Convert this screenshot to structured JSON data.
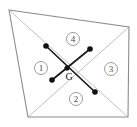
{
  "figure": {
    "canvas": {
      "width": 137,
      "height": 127,
      "background": "#ffffff"
    },
    "colors": {
      "outline": "#8c8c8c",
      "diagonal": "#b9b9b9",
      "connector": "#1a1a1a",
      "dot": "#111111",
      "label": "#4a4a4a"
    },
    "quadrilateral": {
      "name": "outer-quadrilateral",
      "points": "9,10 129,27 128,117 28,117",
      "vertices": [
        {
          "name": "top-left",
          "x": 9,
          "y": 10
        },
        {
          "name": "top-right",
          "x": 129,
          "y": 27
        },
        {
          "name": "bottom-right",
          "x": 128,
          "y": 117
        },
        {
          "name": "bottom-left",
          "x": 28,
          "y": 117
        }
      ]
    },
    "diagonals": [
      {
        "name": "diagonal-tl-br",
        "x1": 9,
        "y1": 10,
        "x2": 128,
        "y2": 117
      },
      {
        "name": "diagonal-tr-bl",
        "x1": 129,
        "y1": 27,
        "x2": 28,
        "y2": 117
      }
    ],
    "centroid": {
      "name": "centroid-G",
      "label": "G",
      "x": 67,
      "y": 68,
      "label_x": 69,
      "label_y": 76,
      "radius": 2.6
    },
    "nodes": [
      {
        "name": "node-upper-left",
        "x": 46,
        "y": 46,
        "radius": 2.8
      },
      {
        "name": "node-upper-right",
        "x": 90,
        "y": 49,
        "radius": 2.8
      },
      {
        "name": "node-lower-left",
        "x": 52,
        "y": 80,
        "radius": 2.8
      },
      {
        "name": "node-lower-right",
        "x": 95,
        "y": 92,
        "radius": 2.8
      }
    ],
    "connectors": [
      {
        "name": "connector-upper-left-to-lower-right",
        "x1": 46,
        "y1": 46,
        "x2": 95,
        "y2": 92
      },
      {
        "name": "connector-upper-right-to-lower-left",
        "x1": 90,
        "y1": 49,
        "x2": 52,
        "y2": 80
      }
    ],
    "sector_labels": [
      {
        "name": "sector-label-1",
        "text": "1",
        "x": 41,
        "y": 68,
        "rx": 6.5,
        "ry": 6.5
      },
      {
        "name": "sector-label-2",
        "text": "2",
        "x": 76,
        "y": 99,
        "rx": 6.5,
        "ry": 6.5
      },
      {
        "name": "sector-label-3",
        "text": "3",
        "x": 111,
        "y": 69,
        "rx": 6.5,
        "ry": 6.5
      },
      {
        "name": "sector-label-4",
        "text": "4",
        "x": 73,
        "y": 39,
        "rx": 6.5,
        "ry": 6.5
      }
    ]
  }
}
